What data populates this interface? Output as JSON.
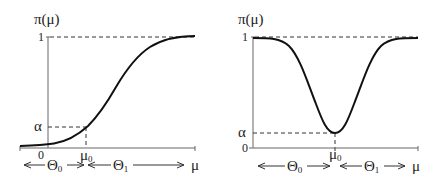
{
  "left_panel": {
    "y_label": "π(μ)",
    "y_tick_top": "1",
    "y_tick_alpha": "α",
    "x_tick_zero": "0",
    "x_tick_mu0": "μ",
    "x_tick_mu0_sub": "0",
    "region_left": "Θ",
    "region_left_sub": "0",
    "region_right": "Θ",
    "region_right_sub": "1",
    "x_label": "μ",
    "curve_shape": "increasing sigmoid"
  },
  "right_panel": {
    "y_label": "π(μ)",
    "y_tick_top": "1",
    "y_tick_alpha": "α",
    "y_tick_zero": "0",
    "x_tick_mu0": "μ",
    "x_tick_mu0_sub": "0",
    "region_left": "Θ",
    "region_left_sub": "0",
    "region_right": "Θ",
    "region_right_sub": "1",
    "x_label": "μ",
    "curve_shape": "inverted bell with minimum α at μ0"
  }
}
